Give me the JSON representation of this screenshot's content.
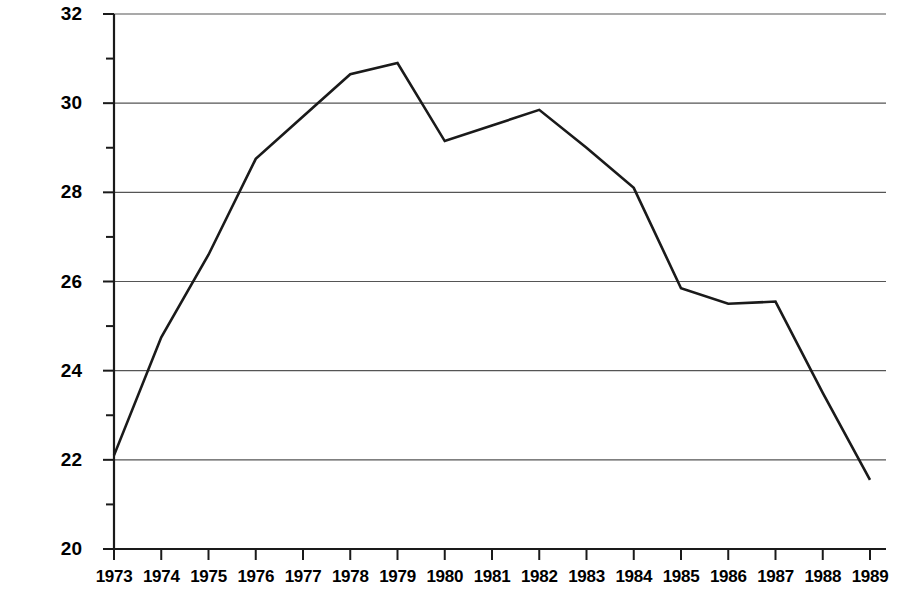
{
  "chart_data": {
    "type": "line",
    "title": "",
    "xlabel": "",
    "ylabel": "Number of prescriptions (millions)",
    "categories": [
      "1973",
      "1974",
      "1975",
      "1976",
      "1977",
      "1978",
      "1979",
      "1980",
      "1981",
      "1982",
      "1983",
      "1984",
      "1985",
      "1986",
      "1987",
      "1988",
      "1989"
    ],
    "x": [
      1973,
      1974,
      1975,
      1976,
      1977,
      1978,
      1979,
      1980,
      1981,
      1982,
      1983,
      1984,
      1985,
      1986,
      1987,
      1988,
      1989
    ],
    "values": [
      22.1,
      24.75,
      26.6,
      28.75,
      29.7,
      30.65,
      30.9,
      29.15,
      29.5,
      29.85,
      29.0,
      28.1,
      25.85,
      25.5,
      25.55,
      23.5,
      21.55
    ],
    "series": [
      {
        "name": "Number of prescriptions",
        "values": [
          22.1,
          24.75,
          26.6,
          28.75,
          29.7,
          30.65,
          30.9,
          29.15,
          29.5,
          29.85,
          29.0,
          28.1,
          25.85,
          25.5,
          25.55,
          23.5,
          21.55
        ]
      }
    ],
    "ylim": [
      20,
      32
    ],
    "xlim": [
      1973,
      1989
    ],
    "ytick_labels": [
      "20",
      "22",
      "24",
      "26",
      "28",
      "30",
      "32"
    ],
    "yticks": [
      20,
      22,
      24,
      26,
      28,
      30,
      32
    ],
    "yminor_ticks": [
      21,
      23,
      25,
      27,
      29,
      31
    ],
    "grid": "horizontal-major",
    "legend": "none",
    "line_color": "#1a1a1a",
    "grid_color": "#555555",
    "axis_color": "#1a1a1a",
    "background_color": "#ffffff"
  },
  "axes": {
    "y_label": "Number of prescriptions (millions)",
    "y_ticks": [
      {
        "label": "32",
        "value": 32
      },
      {
        "label": "30",
        "value": 30
      },
      {
        "label": "28",
        "value": 28
      },
      {
        "label": "26",
        "value": 26
      },
      {
        "label": "24",
        "value": 24
      },
      {
        "label": "22",
        "value": 22
      },
      {
        "label": "20",
        "value": 20
      }
    ],
    "x_ticks": [
      {
        "label": "1973"
      },
      {
        "label": "1974"
      },
      {
        "label": "1975"
      },
      {
        "label": "1976"
      },
      {
        "label": "1977"
      },
      {
        "label": "1978"
      },
      {
        "label": "1979"
      },
      {
        "label": "1980"
      },
      {
        "label": "1981"
      },
      {
        "label": "1982"
      },
      {
        "label": "1983"
      },
      {
        "label": "1984"
      },
      {
        "label": "1985"
      },
      {
        "label": "1986"
      },
      {
        "label": "1987"
      },
      {
        "label": "1988"
      },
      {
        "label": "1989"
      }
    ]
  }
}
